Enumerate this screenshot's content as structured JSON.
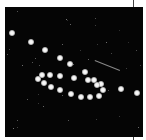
{
  "image": {
    "description": "Multiple-exposure astrophotograph of a planet tracing a retrograde loop against a star field",
    "background_color": "#050505",
    "planet_positions": [
      [
        12,
        33
      ],
      [
        31,
        42
      ],
      [
        45,
        50
      ],
      [
        60,
        58
      ],
      [
        70,
        64
      ],
      [
        85,
        72
      ],
      [
        94,
        80
      ],
      [
        101,
        84
      ],
      [
        103,
        90
      ],
      [
        99,
        96
      ],
      [
        90,
        97
      ],
      [
        81,
        97
      ],
      [
        71,
        94
      ],
      [
        60,
        90
      ],
      [
        51,
        87
      ],
      [
        44,
        83
      ],
      [
        38,
        79
      ],
      [
        42,
        75
      ],
      [
        50,
        75
      ],
      [
        60,
        76
      ],
      [
        74,
        78
      ],
      [
        88,
        80
      ],
      [
        97,
        85
      ],
      [
        121,
        89
      ],
      [
        137,
        93
      ]
    ],
    "streak": {
      "x1": 95,
      "y1": 60,
      "x2": 120,
      "y2": 70
    }
  }
}
